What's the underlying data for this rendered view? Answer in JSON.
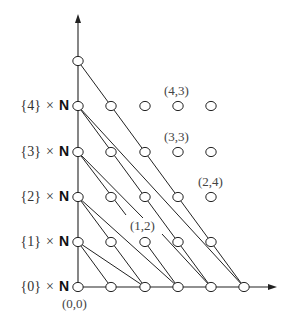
{
  "diagram": {
    "title": "",
    "row_labels": [
      {
        "set": "{0}",
        "times": "×",
        "nat": "N",
        "y": 287
      },
      {
        "set": "{1}",
        "times": "×",
        "nat": "N",
        "y": 242
      },
      {
        "set": "{2}",
        "times": "×",
        "nat": "N",
        "y": 197
      },
      {
        "set": "{3}",
        "times": "×",
        "nat": "N",
        "y": 152
      },
      {
        "set": "{4}",
        "times": "×",
        "nat": "N",
        "y": 106
      }
    ],
    "point_labels": [
      {
        "text": "(0,0)",
        "x": 62,
        "y": 296
      },
      {
        "text": "(1,2)",
        "x": 130,
        "y": 218
      },
      {
        "text": "(2,4)",
        "x": 198,
        "y": 174
      },
      {
        "text": "(3,3)",
        "x": 164,
        "y": 129
      },
      {
        "text": "(4,3)",
        "x": 164,
        "y": 83
      }
    ],
    "grid": {
      "x": [
        78,
        111,
        145,
        178,
        211,
        244
      ],
      "y": [
        287,
        242,
        197,
        152,
        106,
        61
      ]
    },
    "nodes": [
      [
        0,
        0
      ],
      [
        1,
        0
      ],
      [
        2,
        0
      ],
      [
        3,
        0
      ],
      [
        4,
        0
      ],
      [
        5,
        0
      ],
      [
        0,
        1
      ],
      [
        1,
        1
      ],
      [
        2,
        1
      ],
      [
        3,
        1
      ],
      [
        4,
        1
      ],
      [
        0,
        2
      ],
      [
        1,
        2
      ],
      [
        2,
        2
      ],
      [
        3,
        2
      ],
      [
        4,
        2
      ],
      [
        0,
        3
      ],
      [
        1,
        3
      ],
      [
        2,
        3
      ],
      [
        3,
        3
      ],
      [
        4,
        3
      ],
      [
        0,
        4
      ],
      [
        1,
        4
      ],
      [
        2,
        4
      ],
      [
        3,
        4
      ],
      [
        4,
        4
      ],
      [
        0,
        5
      ]
    ],
    "edges": [
      {
        "from": [
          78,
          61
        ],
        "to": [
          244,
          287
        ]
      },
      {
        "from": [
          78,
          106
        ],
        "to": [
          211,
          287
        ]
      },
      {
        "from": [
          78,
          106
        ],
        "to": [
          244,
          287
        ]
      },
      {
        "from": [
          78,
          152
        ],
        "to": [
          126,
          215
        ]
      },
      {
        "from": [
          145,
          242
        ],
        "to": [
          178,
          287
        ]
      },
      {
        "from": [
          78,
          152
        ],
        "to": [
          143,
          218
        ]
      },
      {
        "from": [
          162,
          234
        ],
        "to": [
          211,
          287
        ]
      },
      {
        "from": [
          78,
          197
        ],
        "to": [
          145,
          287
        ]
      },
      {
        "from": [
          78,
          197
        ],
        "to": [
          178,
          287
        ]
      },
      {
        "from": [
          78,
          242
        ],
        "to": [
          111,
          287
        ]
      },
      {
        "from": [
          78,
          242
        ],
        "to": [
          145,
          287
        ]
      }
    ],
    "axes": {
      "y_axis": {
        "from": [
          78,
          287
        ],
        "to": [
          78,
          14
        ]
      },
      "x_axis": {
        "from": [
          78,
          287
        ],
        "to": [
          277,
          287
        ]
      }
    },
    "colors": {
      "line": "#222222",
      "node_fill": "#ffffff",
      "node_stroke": "#222222"
    }
  }
}
